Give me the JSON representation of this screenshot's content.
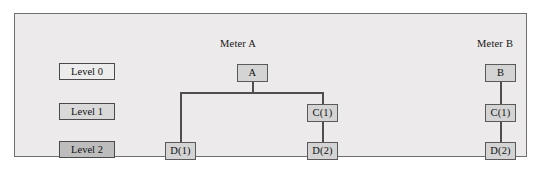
{
  "figure": {
    "background_color": "#eceaea",
    "border_color": "#6f6f6f",
    "node_fill_color": "#d4d4d4",
    "node_border_color": "#5a5a5a",
    "connector_color": "#4f4f4f"
  },
  "legend": {
    "items": [
      {
        "label": "Level 0",
        "fill": "#ececec"
      },
      {
        "label": "Level 1",
        "fill": "#d9d9d9"
      },
      {
        "label": "Level 2",
        "fill": "#bdbdbd"
      }
    ]
  },
  "trees": [
    {
      "title": "Meter A",
      "nodes": {
        "root": "A",
        "c1": "C(1)",
        "d1": "D(1)",
        "d2": "D(2)"
      }
    },
    {
      "title": "Meter B",
      "nodes": {
        "root": "B",
        "c1": "C(1)",
        "d2": "D(2)"
      }
    }
  ]
}
